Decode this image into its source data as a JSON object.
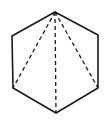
{
  "diagram": {
    "title": "",
    "shape": "regular hexagon",
    "vertices": [
      "top",
      "top-right",
      "bottom-right",
      "bottom",
      "bottom-left",
      "top-left"
    ],
    "solid_edges": [
      [
        "top",
        "top-right"
      ],
      [
        "top-right",
        "bottom-right"
      ],
      [
        "bottom-right",
        "bottom"
      ],
      [
        "bottom",
        "bottom-left"
      ],
      [
        "bottom-left",
        "top-left"
      ],
      [
        "top-left",
        "top"
      ]
    ],
    "dashed_diagonals": [
      [
        "top",
        "bottom-left"
      ],
      [
        "top",
        "bottom"
      ],
      [
        "top",
        "bottom-right"
      ]
    ],
    "colors": {
      "stroke": "#1a1a1a",
      "background": "#ffffff"
    }
  }
}
